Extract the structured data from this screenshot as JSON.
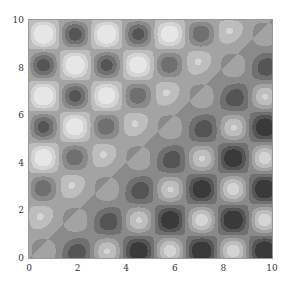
{
  "chart_data": {
    "type": "heatmap",
    "subtype": "contour",
    "title": "",
    "xlabel": "",
    "ylabel": "",
    "xlim": [
      0,
      10
    ],
    "ylim": [
      0,
      10
    ],
    "x_ticks": [
      "0",
      "2",
      "4",
      "6",
      "8",
      "10"
    ],
    "y_ticks": [
      "0",
      "2",
      "4",
      "6",
      "8",
      "10"
    ],
    "grid": false,
    "legend": null,
    "colors": {
      "levels": [
        "#3a3a3a",
        "#555555",
        "#707070",
        "#8a8a8a",
        "#a3a3a3",
        "#bdbdbd",
        "#d4d4d4",
        "#e6e6e6"
      ],
      "frame": "#9a9a9a"
    },
    "blob_grid_spacing": 1.3,
    "blob_centers_top_row_x": [
      0.6,
      1.9,
      3.2,
      4.5,
      5.8,
      7.1
    ]
  }
}
